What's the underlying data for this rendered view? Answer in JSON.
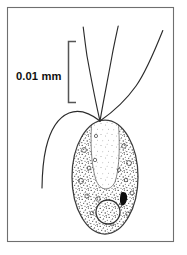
{
  "figure": {
    "kind": "scientific-line-drawing",
    "background_color": "#ffffff",
    "ink_color": "#2b2b2b",
    "frame": {
      "name": "figure-frame",
      "stroke_color": "#6f6f6f",
      "x": 7,
      "y": 7,
      "width": 167,
      "height": 235
    },
    "scale_bar": {
      "label": "0.01 mm",
      "bracket_color": "#555555",
      "bracket_x": 68,
      "bracket_top": 41,
      "bracket_bottom": 103,
      "arm_length": 8,
      "label_x": 16,
      "label_y": 76
    },
    "cell_body": {
      "name": "cell-body",
      "shape": "oval",
      "center_x": 105,
      "center_y": 177,
      "radius_x": 33,
      "radius_y": 57,
      "fill_color": "#ffffff",
      "outline_color": "#3a3a3a",
      "texture": "stipple"
    },
    "gullet": {
      "name": "gullet-reservoir",
      "description": "pale vertical channel from apex",
      "fill_color": "#fdfdfd"
    },
    "nucleus": {
      "name": "nucleus",
      "center_x": 108,
      "center_y": 212,
      "radius": 12,
      "outline_color": "#3a3a3a"
    },
    "eyespot": {
      "name": "eyespot-stigma",
      "center_x": 124,
      "center_y": 199,
      "fill_color": "#0d0d0d"
    },
    "flagella": {
      "name": "flagella",
      "count": 4,
      "origin_x": 100,
      "origin_y": 121,
      "stroke_color": "#2b2b2b"
    }
  },
  "caption": {
    "text": "",
    "clipped": true
  }
}
